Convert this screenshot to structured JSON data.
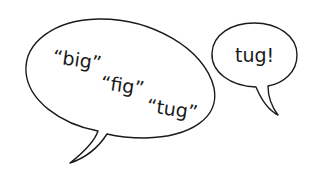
{
  "illustration": {
    "description": "Two hand-drawn speech bubbles",
    "large_bubble": {
      "words": [
        {
          "text": "“big”",
          "x": 52,
          "y": 63,
          "rotate": 8
        },
        {
          "text": "“fig”",
          "x": 100,
          "y": 89,
          "rotate": 8
        },
        {
          "text": "“tug”",
          "x": 146,
          "y": 112,
          "rotate": 8
        }
      ]
    },
    "small_bubble": {
      "text": "tug!"
    },
    "colors": {
      "stroke": "#1a1a1a",
      "background": "#ffffff"
    }
  }
}
